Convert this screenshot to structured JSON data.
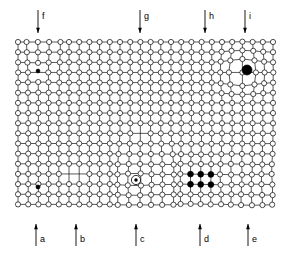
{
  "figure": {
    "background_color": "#ffffff",
    "line_color": "#000000",
    "atom_fill_color": "#ffffff",
    "defect_fill_color": "#000000"
  },
  "lattice": {
    "origin_x": 18,
    "origin_y": 42,
    "spacing_x": 10.2,
    "spacing_y": 10.15,
    "columns": 26,
    "rows": 17,
    "atom_radius": 2.6,
    "bond_width": 0.7
  },
  "top_markers": [
    {
      "id": "marker-f",
      "label": "f",
      "x": 38,
      "arrow_top": 10,
      "arrow_bottom": 33,
      "direction": "down"
    },
    {
      "id": "marker-g",
      "label": "g",
      "x": 140,
      "arrow_top": 10,
      "arrow_bottom": 33,
      "direction": "down"
    },
    {
      "id": "marker-h",
      "label": "h",
      "x": 205,
      "arrow_top": 10,
      "arrow_bottom": 33,
      "direction": "down"
    },
    {
      "id": "marker-i",
      "label": "i",
      "x": 245,
      "arrow_top": 10,
      "arrow_bottom": 33,
      "direction": "down"
    }
  ],
  "bottom_markers": [
    {
      "id": "marker-a",
      "label": "a",
      "x": 36,
      "arrow_top": 224,
      "arrow_bottom": 246,
      "direction": "up"
    },
    {
      "id": "marker-b",
      "label": "b",
      "x": 76,
      "arrow_top": 224,
      "arrow_bottom": 246,
      "direction": "up"
    },
    {
      "id": "marker-c",
      "label": "c",
      "x": 136,
      "arrow_top": 224,
      "arrow_bottom": 246,
      "direction": "up"
    },
    {
      "id": "marker-d",
      "label": "d",
      "x": 200,
      "arrow_top": 224,
      "arrow_bottom": 246,
      "direction": "up"
    },
    {
      "id": "marker-e",
      "label": "e",
      "x": 248,
      "arrow_top": 224,
      "arrow_bottom": 246,
      "direction": "up"
    }
  ],
  "defects": [
    {
      "id": "defect-small-dot-upper-left",
      "kind": "interstitial-small-atom",
      "cx": 38,
      "cy": 71,
      "r": 1.9,
      "fill": "#000000"
    },
    {
      "id": "defect-large-dot-upper-right",
      "kind": "substitutional-large-atom",
      "cx": 247,
      "cy": 70,
      "r": 5.0,
      "fill": "#000000"
    },
    {
      "id": "defect-small-dot-lower-left",
      "kind": "interstitial-small-atom",
      "cx": 38,
      "cy": 187,
      "r": 2.0,
      "fill": "#000000"
    },
    {
      "id": "defect-ring-dot-center",
      "kind": "large-substitutional-ring",
      "cx": 136,
      "cy": 180,
      "r_outer": 4.6,
      "r_inner": 1.7,
      "fill": "#ffffff"
    },
    {
      "id": "defect-cluster-dot-1",
      "kind": "impurity-cluster-atom",
      "cx": 187,
      "cy": 177,
      "r": 3.0,
      "fill": "#000000"
    },
    {
      "id": "defect-cluster-dot-2",
      "kind": "impurity-cluster-atom",
      "cx": 197,
      "cy": 177,
      "r": 3.0,
      "fill": "#000000"
    },
    {
      "id": "defect-cluster-dot-3",
      "kind": "impurity-cluster-atom",
      "cx": 207,
      "cy": 177,
      "r": 3.0,
      "fill": "#000000"
    },
    {
      "id": "defect-cluster-dot-4",
      "kind": "impurity-cluster-atom",
      "cx": 187,
      "cy": 187,
      "r": 3.0,
      "fill": "#000000"
    },
    {
      "id": "defect-cluster-dot-5",
      "kind": "impurity-cluster-atom",
      "cx": 197,
      "cy": 187,
      "r": 3.0,
      "fill": "#000000"
    },
    {
      "id": "defect-cluster-dot-6",
      "kind": "impurity-cluster-atom",
      "cx": 207,
      "cy": 187,
      "r": 3.0,
      "fill": "#000000"
    },
    {
      "id": "defect-vacancy-center",
      "kind": "vacancy",
      "cx": 140,
      "cy": 133,
      "r": 4.6
    }
  ],
  "vacancy_sites": [
    {
      "id": "vacancy-a",
      "col": 12,
      "row": 9
    },
    {
      "id": "vacancy-b",
      "col": 5,
      "row": 13
    },
    {
      "id": "vacancy-c",
      "col": 6,
      "row": 13
    }
  ],
  "dislocations": [
    {
      "id": "dislocation-f",
      "label": "f",
      "type": "edge-dislocation",
      "col": 2,
      "row": 3
    },
    {
      "id": "dislocation-g",
      "label": "g",
      "type": "edge-dislocation",
      "col": 12,
      "row": 11
    },
    {
      "id": "dislocation-h",
      "label": "h",
      "type": "edge-dislocation",
      "col": 18,
      "row": 9
    },
    {
      "id": "dislocation-i",
      "label": "i",
      "type": "substitutional-large",
      "col": 22,
      "row": 3
    }
  ]
}
